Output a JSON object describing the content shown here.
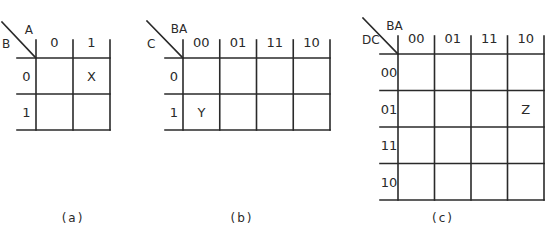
{
  "maps": [
    {
      "id": "a",
      "caption": "(a)",
      "col_var": "A",
      "row_var": "B",
      "col_headers": [
        "0",
        "1"
      ],
      "row_headers": [
        "0",
        "1"
      ],
      "cells": [
        [
          "",
          "X"
        ],
        [
          "",
          ""
        ]
      ]
    },
    {
      "id": "b",
      "caption": "(b)",
      "col_var": "BA",
      "row_var": "C",
      "col_headers": [
        "00",
        "01",
        "11",
        "10"
      ],
      "row_headers": [
        "0",
        "1"
      ],
      "cells": [
        [
          "",
          "",
          "",
          ""
        ],
        [
          "Y",
          "",
          "",
          ""
        ]
      ]
    },
    {
      "id": "c",
      "caption": "(c)",
      "col_var": "BA",
      "row_var": "DC",
      "col_headers": [
        "00",
        "01",
        "11",
        "10"
      ],
      "row_headers": [
        "00",
        "01",
        "11",
        "10"
      ],
      "cells": [
        [
          "",
          "",
          "",
          ""
        ],
        [
          "",
          "",
          "",
          "Z"
        ],
        [
          "",
          "",
          "",
          ""
        ],
        [
          "",
          "",
          "",
          ""
        ]
      ]
    }
  ]
}
